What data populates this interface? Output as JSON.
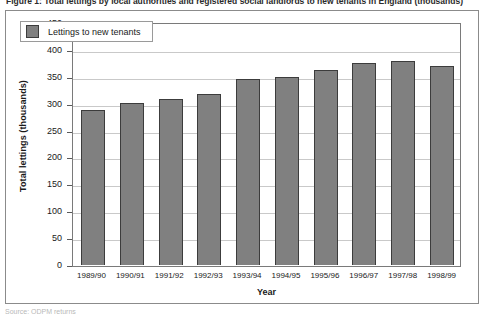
{
  "figure": {
    "top_caption": "Figure 1: Total lettings by local authorities and registered social landlords to new tenants in England (thousands)",
    "bottom_note": "Source: ODPM returns"
  },
  "chart_data": {
    "type": "bar",
    "title": "",
    "xlabel": "Year",
    "ylabel": "Total lettings (thousands)",
    "categories": [
      "1989/90",
      "1990/91",
      "1991/92",
      "1992/93",
      "1993/94",
      "1994/95",
      "1995/96",
      "1996/97",
      "1997/98",
      "1998/99"
    ],
    "series": [
      {
        "name": "Lettings to new tenants",
        "color": "#808080",
        "values": [
          288,
          301,
          308,
          318,
          345,
          349,
          362,
          376,
          379,
          371
        ]
      }
    ],
    "ylim": [
      0,
      450
    ],
    "yticks": [
      0,
      50,
      100,
      150,
      200,
      250,
      300,
      350,
      400,
      450
    ],
    "ytick_labels": [
      "0",
      "50",
      "100",
      "150",
      "200",
      "250",
      "300",
      "350",
      "400",
      "450"
    ],
    "grid": true,
    "legend_position": "top-left",
    "legend_entries": [
      "Lettings to new tenants"
    ]
  }
}
